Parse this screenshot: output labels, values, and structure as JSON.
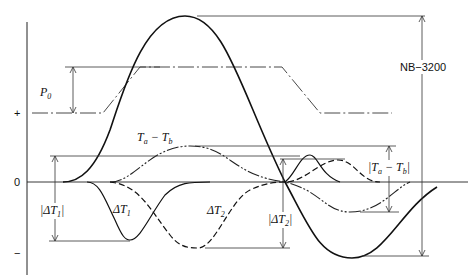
{
  "axis": {
    "plus_label": "+",
    "zero_label": "0",
    "minus_label": "−"
  },
  "labels": {
    "p0": "P",
    "p0_sub": "0",
    "ta_tb": "T",
    "ta_sub": "a",
    "ta_minus": " − T",
    "tb_sub": "b",
    "abs_ta_tb_open": "|T",
    "abs_ta_tb_mid": " − T",
    "abs_ta_tb_close": "|",
    "delta_t1": "ΔT",
    "delta_t1_sub": "1",
    "abs_delta_t1_open": "|ΔT",
    "abs_delta_t1_sub": "1",
    "abs_delta_t1_close": "|",
    "delta_t2": "ΔT",
    "delta_t2_sub": "2",
    "abs_delta_t2_open": "|ΔT",
    "abs_delta_t2_sub": "2",
    "abs_delta_t2_close": "|",
    "nb_3200": "NB−3200"
  },
  "curves": [
    {
      "name": "total-stress",
      "style": "solid-thick"
    },
    {
      "name": "pressure",
      "style": "dash-dot"
    },
    {
      "name": "ta-tb",
      "style": "dash-dot-dot"
    },
    {
      "name": "delta-t1",
      "style": "solid"
    },
    {
      "name": "delta-t2",
      "style": "dashed"
    }
  ]
}
